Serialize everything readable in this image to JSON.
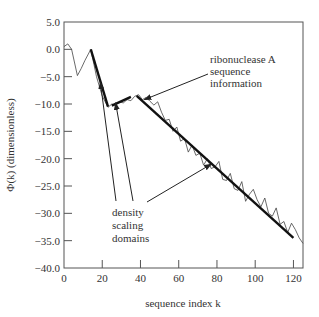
{
  "chart_data": {
    "type": "line",
    "title": "",
    "xlabel": "sequence index k",
    "ylabel": "Φ(k) (dimensionless)",
    "xlim": [
      0,
      125
    ],
    "ylim": [
      -40,
      5
    ],
    "xticks": [
      0,
      20,
      40,
      60,
      80,
      100,
      120
    ],
    "xtick_labels": [
      "0",
      "20",
      "40",
      "60",
      "80",
      "100",
      "120"
    ],
    "yticks": [
      5,
      0,
      -5,
      -10,
      -15,
      -20,
      -25,
      -30,
      -35,
      -40
    ],
    "ytick_labels": [
      "5.0",
      "0.0",
      "−5.0",
      "−10.0",
      "−15.0",
      "−20.0",
      "−25.0",
      "−30.0",
      "−35.0",
      "−40.0"
    ],
    "grid": false,
    "legend": null,
    "series": [
      {
        "name": "ribonuclease A sequence information",
        "style": "thin",
        "x": [
          0,
          2,
          4,
          7,
          9,
          11,
          14,
          17,
          20,
          23,
          25,
          27,
          29,
          31,
          33,
          35,
          37,
          39,
          41,
          43,
          45,
          47,
          49,
          51,
          53,
          55,
          57,
          59,
          61,
          63,
          65,
          67,
          69,
          71,
          73,
          75,
          77,
          79,
          81,
          83,
          85,
          87,
          89,
          91,
          93,
          95,
          97,
          99,
          101,
          103,
          105,
          107,
          109,
          111,
          113,
          115,
          117,
          119,
          121,
          123,
          125
        ],
        "y": [
          0.5,
          1.0,
          0.0,
          -4.8,
          -3.5,
          -2.0,
          0.0,
          -5.0,
          -8.5,
          -10.6,
          -10.0,
          -10.2,
          -9.6,
          -9.8,
          -9.2,
          -9.4,
          -8.6,
          -8.3,
          -9.2,
          -8.8,
          -9.5,
          -10.2,
          -9.6,
          -11.5,
          -13.0,
          -12.8,
          -15.0,
          -14.2,
          -16.8,
          -16.3,
          -18.8,
          -17.5,
          -19.4,
          -19.0,
          -21.2,
          -20.0,
          -21.8,
          -21.5,
          -20.5,
          -23.8,
          -24.0,
          -22.7,
          -25.5,
          -25.8,
          -24.2,
          -27.8,
          -26.5,
          -25.6,
          -27.5,
          -28.8,
          -27.2,
          -30.0,
          -30.5,
          -29.0,
          -32.0,
          -31.5,
          -33.5,
          -31.8,
          -33.0,
          -34.5,
          -35.5
        ]
      },
      {
        "name": "density scaling domain 1",
        "style": "thick",
        "x": [
          14,
          23
        ],
        "y": [
          0.0,
          -10.5
        ]
      },
      {
        "name": "density scaling domain 2",
        "style": "thick",
        "x": [
          25,
          35
        ],
        "y": [
          -10.3,
          -8.7
        ]
      },
      {
        "name": "density scaling domain 3",
        "style": "thick",
        "x": [
          38,
          120
        ],
        "y": [
          -8.5,
          -34.5
        ]
      }
    ],
    "annotations": [
      {
        "text": [
          "ribonuclease A",
          "sequence",
          "information"
        ],
        "arrow_to": [
          41,
          -9.2
        ]
      },
      {
        "text": [
          "density",
          "scaling",
          "domains"
        ],
        "arrows_to": [
          [
            19,
            -6.0
          ],
          [
            27,
            -9.8
          ],
          [
            77,
            -21.0
          ]
        ]
      }
    ]
  }
}
